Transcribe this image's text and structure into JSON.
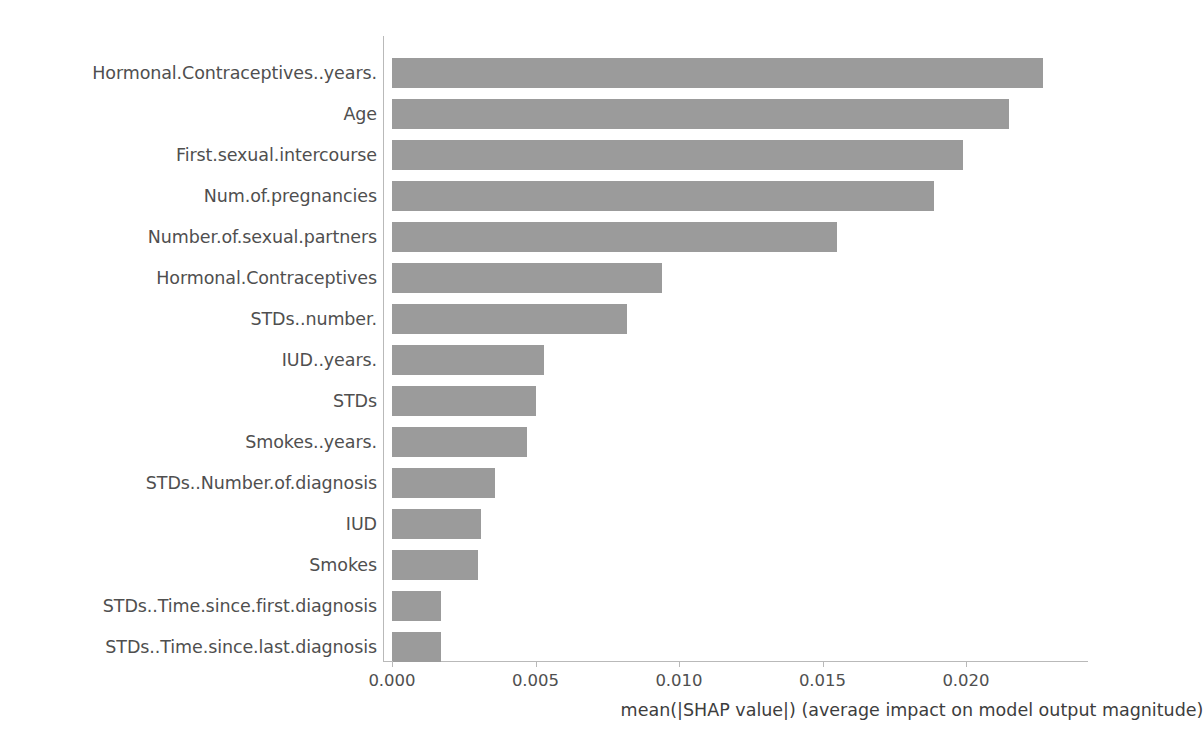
{
  "chart_data": {
    "type": "bar",
    "orientation": "horizontal",
    "title": "",
    "xlabel": "mean(|SHAP value|) (average impact on model output magnitude)",
    "ylabel": "",
    "xlim": [
      0,
      0.0246
    ],
    "grid": false,
    "legend": null,
    "bar_color": "#9b9b9b",
    "axis_color": "#b9b9b9",
    "text_color": "#4f4f4f",
    "xticks": [
      "0.000",
      "0.005",
      "0.010",
      "0.015",
      "0.020"
    ],
    "xtick_values": [
      0.0,
      0.005,
      0.01,
      0.015,
      0.02
    ],
    "categories": [
      "Hormonal.Contraceptives..years.",
      "Age",
      "First.sexual.intercourse",
      "Num.of.pregnancies",
      "Number.of.sexual.partners",
      "Hormonal.Contraceptives",
      "STDs..number.",
      "IUD..years.",
      "STDs",
      "Smokes..years.",
      "STDs..Number.of.diagnosis",
      "IUD",
      "Smokes",
      "STDs..Time.since.first.diagnosis",
      "STDs..Time.since.last.diagnosis"
    ],
    "values": [
      0.0227,
      0.0215,
      0.0199,
      0.0189,
      0.0155,
      0.0094,
      0.0082,
      0.0053,
      0.005,
      0.0047,
      0.0036,
      0.0031,
      0.003,
      0.0017,
      0.0017
    ]
  }
}
